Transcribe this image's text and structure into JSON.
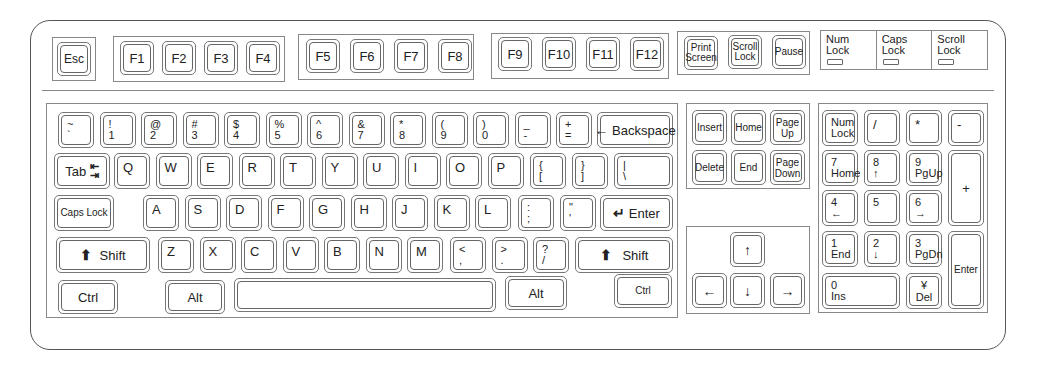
{
  "function_row": {
    "esc": "Esc",
    "f_keys": [
      "F1",
      "F2",
      "F3",
      "F4",
      "F5",
      "F6",
      "F7",
      "F8",
      "F9",
      "F10",
      "F11",
      "F12"
    ],
    "system_keys": [
      {
        "label_top": "Print",
        "label_bottom": "Screen"
      },
      {
        "label_top": "Scroll",
        "label_bottom": "Lock"
      },
      {
        "label_top": "Pause",
        "label_bottom": ""
      }
    ],
    "indicators": [
      {
        "label_top": "Num",
        "label_bottom": "Lock"
      },
      {
        "label_top": "Caps",
        "label_bottom": "Lock"
      },
      {
        "label_top": "Scroll",
        "label_bottom": "Lock"
      }
    ]
  },
  "main": {
    "number_row": [
      {
        "shift": "~",
        "base": "`"
      },
      {
        "shift": "!",
        "base": "1"
      },
      {
        "shift": "@",
        "base": "2"
      },
      {
        "shift": "#",
        "base": "3"
      },
      {
        "shift": "$",
        "base": "4"
      },
      {
        "shift": "%",
        "base": "5"
      },
      {
        "shift": "^",
        "base": "6"
      },
      {
        "shift": "&",
        "base": "7"
      },
      {
        "shift": "*",
        "base": "8"
      },
      {
        "shift": "(",
        "base": "9"
      },
      {
        "shift": ")",
        "base": "0"
      },
      {
        "shift": "_",
        "base": "-"
      },
      {
        "shift": "+",
        "base": "="
      }
    ],
    "backspace": "Backspace",
    "tab": "Tab",
    "qwerty_row": [
      "Q",
      "W",
      "E",
      "R",
      "T",
      "Y",
      "U",
      "I",
      "O",
      "P"
    ],
    "brackets": [
      {
        "shift": "{",
        "base": "["
      },
      {
        "shift": "}",
        "base": "]"
      },
      {
        "shift": "|",
        "base": "\\"
      }
    ],
    "caps_lock": "Caps Lock",
    "home_row": [
      "A",
      "S",
      "D",
      "F",
      "G",
      "H",
      "J",
      "K",
      "L"
    ],
    "home_punct": [
      {
        "shift": ":",
        "base": ";"
      },
      {
        "shift": "\"",
        "base": "'"
      }
    ],
    "enter": "Enter",
    "shift_left": "Shift",
    "bottom_letters": [
      "Z",
      "X",
      "C",
      "V",
      "B",
      "N",
      "M"
    ],
    "bottom_punct": [
      {
        "shift": "<",
        "base": ","
      },
      {
        "shift": ">",
        "base": "."
      },
      {
        "shift": "?",
        "base": "/"
      }
    ],
    "shift_right": "Shift",
    "ctrl_left": "Ctrl",
    "alt_left": "Alt",
    "space": "",
    "alt_right": "Alt",
    "ctrl_right": "Ctrl"
  },
  "nav": {
    "keys": [
      {
        "top": "Insert",
        "bottom": ""
      },
      {
        "top": "Home",
        "bottom": ""
      },
      {
        "top": "Page",
        "bottom": "Up"
      },
      {
        "top": "Delete",
        "bottom": ""
      },
      {
        "top": "End",
        "bottom": ""
      },
      {
        "top": "Page",
        "bottom": "Down"
      }
    ],
    "arrows": {
      "up": "↑",
      "left": "←",
      "down": "↓",
      "right": "→"
    }
  },
  "numpad": {
    "num_lock": {
      "top": "Num",
      "bottom": "Lock"
    },
    "divide": "/",
    "multiply": "*",
    "minus": "-",
    "plus": "+",
    "enter": "Enter",
    "keys": [
      {
        "num": "7",
        "sub": "Home"
      },
      {
        "num": "8",
        "sub": "↑"
      },
      {
        "num": "9",
        "sub": "PgUp"
      },
      {
        "num": "4",
        "sub": "←"
      },
      {
        "num": "5",
        "sub": ""
      },
      {
        "num": "6",
        "sub": "→"
      },
      {
        "num": "1",
        "sub": "End"
      },
      {
        "num": "2",
        "sub": "↓"
      },
      {
        "num": "3",
        "sub": "PgDn"
      }
    ],
    "zero": {
      "num": "0",
      "sub": "Ins"
    },
    "dot": {
      "num": "¥",
      "sub": "Del"
    }
  }
}
